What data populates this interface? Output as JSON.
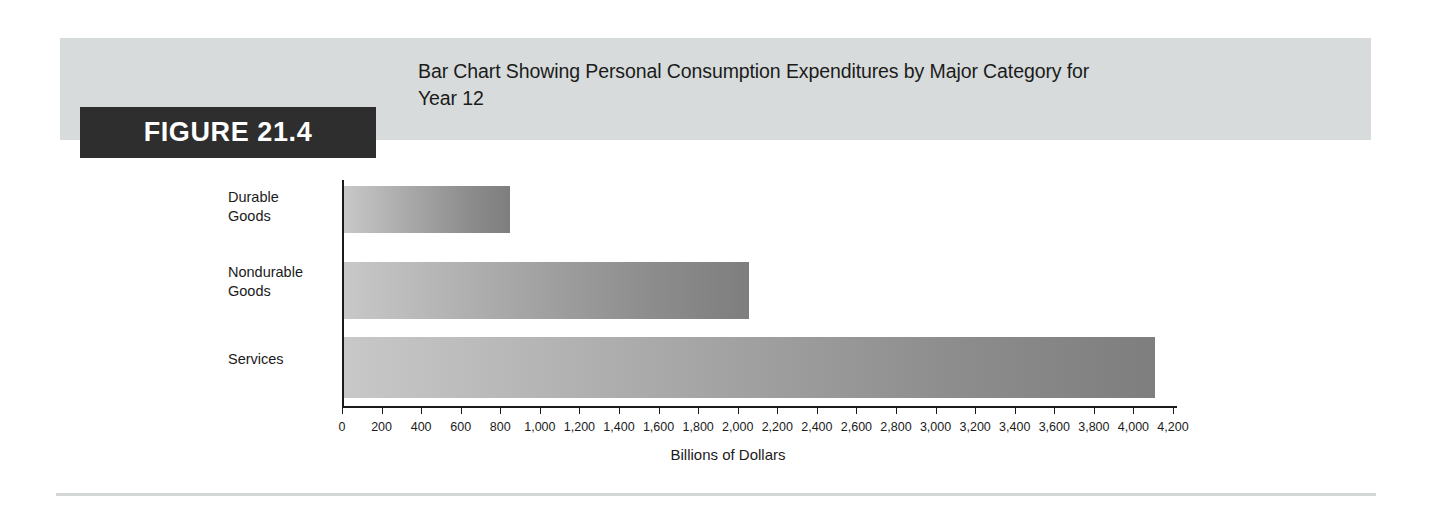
{
  "figure": {
    "badge_label": "FIGURE 21.4",
    "title": "Bar Chart Showing Personal Consumption Expenditures by Major Category for Year 12"
  },
  "colors": {
    "header_band": "#d8dbdc",
    "badge_background": "#2e2e2e",
    "badge_text": "#ffffff",
    "axis": "#1a1a1a",
    "bar_gradient_start": "#c8c8c8",
    "bar_gradient_end": "#7e7e7e",
    "bottom_rule": "#d4d7d8",
    "text": "#1b1b1b"
  },
  "chart_data": {
    "type": "bar",
    "orientation": "horizontal",
    "title": "Bar Chart Showing Personal Consumption Expenditures by Major Category for Year 12",
    "categories": [
      "Durable Goods",
      "Nondurable Goods",
      "Services"
    ],
    "values": [
      840,
      2045,
      4100
    ],
    "xlabel": "Billions of Dollars",
    "ylabel": "",
    "xlim": [
      0,
      4200
    ],
    "xtick_step": 200,
    "grid": false,
    "legend": false,
    "tick_labels": [
      "0",
      "200",
      "400",
      "600",
      "800",
      "1,000",
      "1,200",
      "1,400",
      "1,600",
      "1,800",
      "2,000",
      "2,200",
      "2,400",
      "2,600",
      "2,800",
      "3,000",
      "3,200",
      "3,400",
      "3,600",
      "3,800",
      "4,000",
      "4,200"
    ],
    "category_labels_wrapped": [
      [
        "Durable",
        "Goods"
      ],
      [
        "Nondurable",
        "Goods"
      ],
      [
        "Services"
      ]
    ]
  }
}
